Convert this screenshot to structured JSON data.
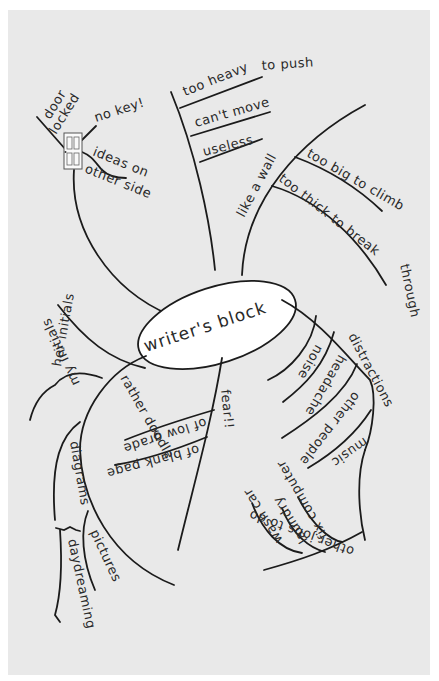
{
  "diagram": {
    "type": "mind-map",
    "center": {
      "label": "writer's block"
    },
    "branches": [
      {
        "label": "door locked",
        "children": [
          {
            "label": "no key!"
          },
          {
            "label": "ideas on other side"
          }
        ],
        "icon": "door-icon"
      },
      {
        "label": "heavy",
        "children": [
          {
            "label": "too heavy to push"
          },
          {
            "label": "can't move"
          },
          {
            "label": "useless"
          }
        ]
      },
      {
        "label": "like a wall",
        "children": [
          {
            "label": "too big to climb"
          },
          {
            "label": "too thick to break through"
          }
        ]
      },
      {
        "label": "distractions",
        "children": [
          {
            "label": "noise"
          },
          {
            "label": "headache"
          },
          {
            "label": "other people"
          },
          {
            "label": "music"
          }
        ]
      },
      {
        "label": "other jobs to do",
        "children": [
          {
            "label": "wash car"
          },
          {
            "label": "laundry"
          },
          {
            "label": "fix computer"
          }
        ]
      },
      {
        "label": "fear!!",
        "children": [
          {
            "label": "of low grade"
          },
          {
            "label": "of blank page"
          }
        ]
      },
      {
        "label": "rather doodle",
        "children": [
          {
            "label": "her initials"
          },
          {
            "label": "my initials"
          },
          {
            "label": "diagrams"
          },
          {
            "label": "pictures"
          },
          {
            "label": "daydreaming"
          }
        ]
      }
    ]
  }
}
